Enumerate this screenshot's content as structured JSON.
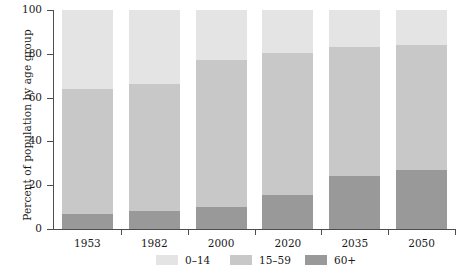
{
  "chart_data": {
    "type": "bar",
    "stacked": true,
    "title": "",
    "xlabel": "",
    "ylabel": "Percent of population by age group",
    "categories": [
      "1953",
      "1982",
      "2000",
      "2020",
      "2035",
      "2050"
    ],
    "ylim": [
      0,
      100
    ],
    "yticks": [
      0,
      20,
      40,
      60,
      80,
      100
    ],
    "ytick_labels": [
      "0",
      "20",
      "40",
      "60",
      "80",
      "100"
    ],
    "grid": false,
    "legend_position": "bottom",
    "stack_order_bottom_to_top": [
      "60+",
      "15-59",
      "0-14"
    ],
    "series": [
      {
        "name": "60+",
        "color": "#999999",
        "values": [
          7,
          8,
          10,
          15.5,
          24,
          27
        ]
      },
      {
        "name": "15-59",
        "color": "#c8c8c8",
        "values": [
          57,
          58,
          67,
          65,
          59,
          57
        ]
      },
      {
        "name": "0-14",
        "color": "#e4e4e4",
        "values": [
          36,
          34,
          23,
          19.5,
          17,
          16
        ]
      }
    ],
    "cumulative_tops": {
      "60+": [
        7,
        8,
        10,
        15.5,
        24,
        27
      ],
      "15-59": [
        64,
        66,
        77,
        80.5,
        83,
        84
      ],
      "0-14": [
        100,
        100,
        100,
        100,
        100,
        100
      ]
    }
  },
  "legend": {
    "items": [
      {
        "label": "0–14",
        "color": "#e4e4e4"
      },
      {
        "label": "15–59",
        "color": "#c8c8c8"
      },
      {
        "label": "60+",
        "color": "#999999"
      }
    ]
  },
  "axis": {
    "y_title": "Percent of population by age group"
  }
}
